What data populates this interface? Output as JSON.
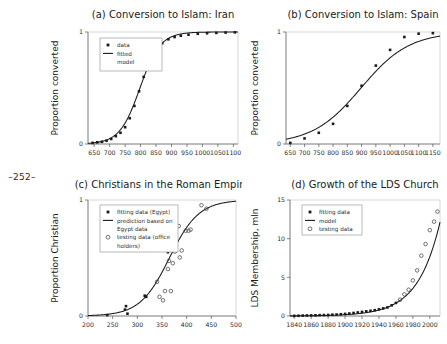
{
  "page": {
    "marker": "–252–"
  },
  "chart_data": [
    {
      "id": "a",
      "type": "scatter",
      "title": "(a) Conversion to Islam: Iran",
      "xlabel": "",
      "ylabel": "Proportion converted",
      "xlim": [
        630,
        1115
      ],
      "ylim": [
        0,
        1
      ],
      "xticks": [
        650,
        700,
        750,
        800,
        850,
        900,
        950,
        1000,
        1050,
        1100
      ],
      "yticks": [
        0,
        1
      ],
      "ytick_labels": [
        "0",
        "1"
      ],
      "grid": false,
      "legend_position": "top-left",
      "legend": [
        {
          "label": "data",
          "marker": "filled-square"
        },
        {
          "label": "fitted",
          "marker": "line"
        },
        {
          "label": "model",
          "marker": "none"
        }
      ],
      "series": [
        {
          "name": "data",
          "marker": "filled-square",
          "x": [
            645,
            660,
            675,
            690,
            705,
            720,
            735,
            750,
            765,
            780,
            795,
            810,
            825,
            840,
            855,
            870,
            890,
            910,
            930,
            955,
            985,
            1015,
            1045,
            1075,
            1105
          ],
          "y": [
            0.01,
            0.015,
            0.02,
            0.03,
            0.045,
            0.07,
            0.1,
            0.15,
            0.23,
            0.34,
            0.47,
            0.6,
            0.71,
            0.8,
            0.865,
            0.9,
            0.935,
            0.955,
            0.967,
            0.976,
            0.984,
            0.989,
            0.992,
            0.995,
            0.997
          ]
        },
        {
          "name": "fitted model",
          "marker": "line",
          "curve": "logistic",
          "midpoint": 798,
          "rate": 0.0305,
          "amplitude": 1.0
        }
      ]
    },
    {
      "id": "b",
      "type": "scatter",
      "title": "(b) Conversion to Islam: Spain",
      "xlabel": "",
      "ylabel": "Proportion converted",
      "xlim": [
        635,
        1175
      ],
      "ylim": [
        0,
        1
      ],
      "xticks": [
        650,
        700,
        750,
        800,
        850,
        900,
        950,
        1000,
        1050,
        1100,
        1150
      ],
      "yticks": [
        0,
        1
      ],
      "ytick_labels": [
        "0",
        "1"
      ],
      "grid": false,
      "legend_position": "none",
      "legend": [],
      "series": [
        {
          "name": "data",
          "marker": "filled-square",
          "x": [
            650,
            700,
            750,
            800,
            850,
            900,
            950,
            1000,
            1050,
            1100,
            1150
          ],
          "y": [
            0.01,
            0.05,
            0.1,
            0.18,
            0.34,
            0.52,
            0.7,
            0.84,
            0.955,
            0.985,
            0.99
          ]
        },
        {
          "name": "fitted model",
          "marker": "line",
          "curve": "logistic",
          "midpoint": 898,
          "rate": 0.0118,
          "amplitude": 1.0
        }
      ]
    },
    {
      "id": "c",
      "type": "scatter",
      "title": "(c) Christians in the Roman Empire",
      "xlabel": "",
      "ylabel": "Proportion Christian",
      "xlim": [
        200,
        500
      ],
      "ylim": [
        0,
        1
      ],
      "xticks": [
        200,
        250,
        300,
        350,
        400,
        450,
        500
      ],
      "yticks": [
        0,
        1
      ],
      "ytick_labels": [
        "0",
        "1"
      ],
      "grid": false,
      "legend_position": "top-left",
      "legend": [
        {
          "label": "fitting data (Egypt)",
          "marker": "filled-square"
        },
        {
          "label": "prediction based on",
          "marker": "line"
        },
        {
          "label": "Egypt data",
          "marker": "none"
        },
        {
          "label": "testing data (office",
          "marker": "open-circle"
        },
        {
          "label": "holders)",
          "marker": "none"
        }
      ],
      "series": [
        {
          "name": "fitting data (Egypt)",
          "marker": "filled-square",
          "x": [
            239,
            275,
            277,
            280,
            315,
            318,
            362
          ],
          "y": [
            0.008,
            0.055,
            0.085,
            0.02,
            0.175,
            0.165,
            0.55
          ]
        },
        {
          "name": "testing data (office holders)",
          "marker": "open-circle",
          "x": [
            340,
            345,
            352,
            356,
            362,
            364,
            366,
            368,
            372,
            376,
            384,
            386,
            390,
            398,
            404,
            408,
            430,
            440
          ],
          "y": [
            0.295,
            0.165,
            0.135,
            0.215,
            0.405,
            0.475,
            0.845,
            0.215,
            0.455,
            0.555,
            0.775,
            0.505,
            0.565,
            0.735,
            0.735,
            0.745,
            0.955,
            0.925
          ]
        },
        {
          "name": "prediction based on Egypt data",
          "marker": "line",
          "curve": "logistic",
          "midpoint": 365,
          "rate": 0.0335,
          "amplitude": 1.0
        }
      ]
    },
    {
      "id": "d",
      "type": "scatter",
      "title": "(d) Growth of the LDS Church",
      "xlabel": "",
      "ylabel": "LDS Membership, mln",
      "xlim": [
        1835,
        2012
      ],
      "ylim": [
        0,
        15
      ],
      "xticks": [
        1840,
        1860,
        1880,
        1900,
        1920,
        1940,
        1960,
        1980,
        2000
      ],
      "yticks": [
        0,
        5,
        10,
        15
      ],
      "ytick_labels": [
        "0",
        "5",
        "10",
        "15"
      ],
      "grid": false,
      "legend_position": "top-left",
      "legend": [
        {
          "label": "fitting data",
          "marker": "filled-square"
        },
        {
          "label": "model",
          "marker": "line"
        },
        {
          "label": "testing data",
          "marker": "open-circle"
        }
      ],
      "series": [
        {
          "name": "fitting data",
          "marker": "filled-square",
          "x": [
            1840,
            1845,
            1850,
            1855,
            1860,
            1865,
            1870,
            1875,
            1880,
            1885,
            1890,
            1895,
            1900,
            1905,
            1910,
            1915,
            1920,
            1925,
            1930,
            1935,
            1940,
            1945,
            1950,
            1955,
            1960
          ],
          "y": [
            0.017,
            0.03,
            0.052,
            0.068,
            0.077,
            0.09,
            0.11,
            0.12,
            0.134,
            0.166,
            0.188,
            0.23,
            0.27,
            0.32,
            0.39,
            0.46,
            0.53,
            0.6,
            0.67,
            0.75,
            0.86,
            0.98,
            1.11,
            1.38,
            1.69
          ]
        },
        {
          "name": "testing data",
          "marker": "open-circle",
          "x": [
            1965,
            1970,
            1975,
            1980,
            1985,
            1990,
            1995,
            2000,
            2005,
            2009
          ],
          "y": [
            2.1,
            2.8,
            3.4,
            4.6,
            5.9,
            7.8,
            9.3,
            11.1,
            12.2,
            13.5
          ]
        },
        {
          "name": "model",
          "marker": "line",
          "curve": "exponential",
          "base_year": 1840,
          "base_value": 0.017,
          "rate": 0.0382
        }
      ]
    }
  ]
}
